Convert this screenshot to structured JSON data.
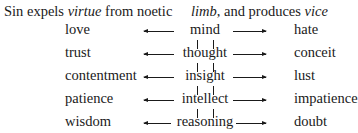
{
  "header": {
    "part1_a": "Sin expels ",
    "part1_italic": "virtue",
    "part1_b": " from noetic",
    "part2_italic": "limb",
    "part2_b": ", and produces ",
    "part2_italic2": "vice"
  },
  "rows": [
    {
      "virtue": "love",
      "faculty": "mind",
      "vice": "hate"
    },
    {
      "virtue": "trust",
      "faculty": "thought",
      "vice": "conceit"
    },
    {
      "virtue": "contentment",
      "faculty": "insight",
      "vice": "lust"
    },
    {
      "virtue": "patience",
      "faculty": "intellect",
      "vice": "impatience"
    },
    {
      "virtue": "wisdom",
      "faculty": "reasoning",
      "vice": "doubt"
    }
  ]
}
